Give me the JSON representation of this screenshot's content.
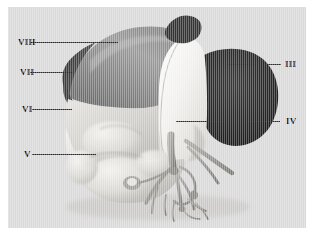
{
  "figure": {
    "kind": "anatomical-3d-render",
    "view": "anterior-superior oblique",
    "colors": {
      "page_background": "#ffffff",
      "panel_background": "#d9d9d9",
      "leader_line": "#2b2b2b",
      "label_text": "#111111",
      "segment_viii": "#8d8d8d",
      "segment_vii": "#4a4a4a",
      "segment_vi": "#c9c7c2",
      "segment_v": "#d2d0cb",
      "segment_iv": "#f2f1ee",
      "segment_iii": "#2a2a2a",
      "vessels": "#9a9792",
      "notch": "#3a3a3a"
    },
    "labels": [
      {
        "id": "viii",
        "text": "VIII",
        "side": "left",
        "text_x": 18,
        "text_y": 38,
        "line_x": 30,
        "line_y": 42,
        "line_w": 88
      },
      {
        "id": "vii",
        "text": "VII",
        "side": "left",
        "text_x": 20,
        "text_y": 68,
        "line_x": 30,
        "line_y": 72,
        "line_w": 43
      },
      {
        "id": "vi",
        "text": "VI",
        "side": "left",
        "text_x": 22,
        "text_y": 105,
        "line_x": 32,
        "line_y": 109,
        "line_w": 40
      },
      {
        "id": "v",
        "text": "V",
        "side": "left",
        "text_x": 24,
        "text_y": 150,
        "line_x": 32,
        "line_y": 154,
        "line_w": 64
      },
      {
        "id": "iii",
        "text": "III",
        "side": "right",
        "text_x": 285,
        "text_y": 60,
        "line_x": 228,
        "line_y": 64,
        "line_w": 53
      },
      {
        "id": "iv",
        "text": "IV",
        "side": "right",
        "text_x": 286,
        "text_y": 117,
        "line_x": 176,
        "line_y": 121,
        "line_w": 104
      }
    ]
  }
}
